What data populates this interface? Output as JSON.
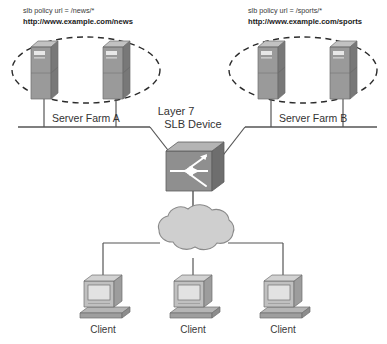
{
  "diagram": {
    "background_color": "#ffffff",
    "line_color": "#555555",
    "colors": {
      "server_front": "#9a9a9a",
      "server_side": "#7b7b7b",
      "server_top": "#c0c0c0",
      "switch_front": "#8f8f8f",
      "switch_side": "#6e6e6e",
      "switch_top": "#b4b4b4",
      "cloud_fill": "#cfcfcf",
      "cloud_stroke": "#8a8a8a",
      "monitor_front": "#bdbdbd",
      "monitor_screen": "#dcdcdc",
      "base_fill": "#aaaaaa"
    }
  },
  "left_farm": {
    "policy_text": "slb policy url = /news/*",
    "url_text": "http://www.example.com/news",
    "farm_label": "Server Farm A",
    "servers": [
      {
        "name": "server-a1"
      },
      {
        "name": "server-a2"
      }
    ],
    "grouping": "dashed-ellipse"
  },
  "right_farm": {
    "policy_text": "slb policy url = /sports/*",
    "url_text": "http://www.example.com/sports",
    "farm_label": "Server Farm B",
    "servers": [
      {
        "name": "server-b1"
      },
      {
        "name": "server-b2"
      }
    ],
    "grouping": "dashed-ellipse"
  },
  "slb_device": {
    "label_line_1": "Layer 7",
    "label_line_2": "SLB Device",
    "icon": "switch-icon"
  },
  "network_cloud": {
    "icon": "cloud-icon",
    "label": ""
  },
  "clients": [
    {
      "label": "Client"
    },
    {
      "label": "Client"
    },
    {
      "label": "Client"
    }
  ]
}
